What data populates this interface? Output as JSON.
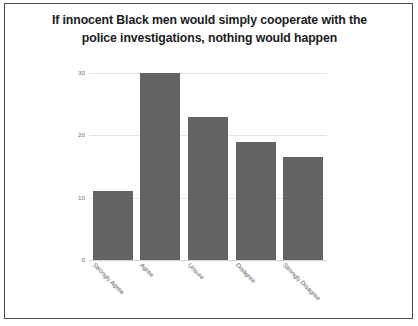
{
  "slide": {
    "title_line1": "If innocent Black men would simply cooperate with the",
    "title_line2": "police investigations, nothing would happen"
  },
  "chart_data": {
    "type": "bar",
    "title": "If innocent Black men would simply cooperate with the police investigations, nothing would happen",
    "xlabel": "",
    "ylabel": "",
    "categories": [
      "Strongly Agree",
      "Agree",
      "Unsure",
      "Disagree",
      "Strongly Disagree"
    ],
    "values": [
      11,
      30,
      23,
      19,
      16.5
    ],
    "ylim": [
      0,
      30
    ],
    "yticks": [
      0,
      10,
      20,
      30
    ],
    "ytick_labels": [
      "0",
      "10",
      "20",
      "30"
    ],
    "grid": true,
    "legend": false,
    "series_color": "#636363",
    "grid_color": "#e3e3e3",
    "axis_text_color": "#6f6f6f",
    "title_color": "#1b1b1b",
    "background": "#ffffff",
    "border_color": "#4b4b4b"
  }
}
